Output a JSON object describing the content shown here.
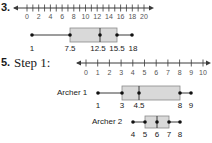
{
  "problems": [
    {
      "number_label": "3.",
      "number_line": {
        "min": 0,
        "max": 20,
        "tick_step": 1,
        "label_step": 2,
        "tick_labels": [
          "0",
          "2",
          "4",
          "6",
          "8",
          "10",
          "12",
          "14",
          "16",
          "18",
          "20"
        ]
      },
      "box_plot": {
        "min": 1,
        "q1": 7.5,
        "median": 12.5,
        "q3": 15.5,
        "max": 18,
        "labels": [
          "1",
          "7.5",
          "12.5",
          "15.5",
          "18"
        ]
      }
    },
    {
      "number_label": "5.",
      "step_label": "Step 1:",
      "number_line": {
        "min": 0,
        "max": 10,
        "tick_step": 1,
        "label_step": 1,
        "tick_labels": [
          "0",
          "1",
          "2",
          "3",
          "4",
          "5",
          "6",
          "7",
          "8",
          "9",
          "10"
        ]
      },
      "box_plots": [
        {
          "name": "Archer 1",
          "min": 1,
          "q1": 3,
          "median": 4.5,
          "q3": 8,
          "max": 9,
          "labels": [
            "1",
            "3",
            "4.5",
            "8",
            "9"
          ]
        },
        {
          "name": "Archer 2",
          "min": 4,
          "q1": 5,
          "median": 6,
          "q3": 7,
          "max": 8,
          "labels": [
            "4",
            "5",
            "6",
            "7",
            "8"
          ]
        }
      ]
    }
  ],
  "colors": {
    "box_fill": "#d9d9d9",
    "box_stroke": "#8a8a8a",
    "line": "#3a3a3a",
    "dot": "#111111"
  }
}
